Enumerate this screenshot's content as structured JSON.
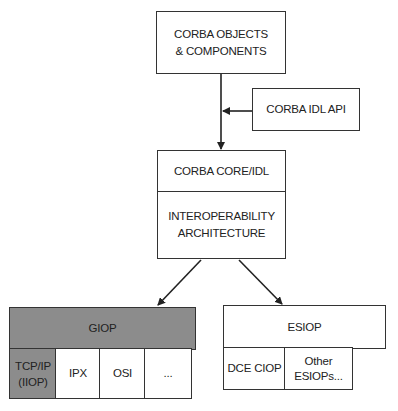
{
  "diagram": {
    "top_box": {
      "line1": "CORBA OBJECTS",
      "line2": "& COMPONENTS"
    },
    "idl_api_box": {
      "label": "CORBA IDL API"
    },
    "core_box": {
      "top_label": "CORBA CORE/IDL",
      "bottom_line1": "INTEROPERABILITY",
      "bottom_line2": "ARCHITECTURE"
    },
    "giop": {
      "label": "GIOP",
      "fill_color": "#8c8c8c",
      "transports": [
        {
          "line1": "TCP/IP",
          "line2": "(IIOP)",
          "highlighted": true
        },
        {
          "line1": "IPX"
        },
        {
          "line1": "OSI"
        },
        {
          "line1": "..."
        }
      ]
    },
    "esiop": {
      "label": "ESIOP",
      "protocols": [
        {
          "line1": "DCE CIOP"
        },
        {
          "line1": "Other",
          "line2": "ESIOPs..."
        }
      ]
    },
    "arrows": [
      {
        "from": "top_box",
        "to": "core_box"
      },
      {
        "from": "idl_api_box",
        "to": "top_to_core_line"
      },
      {
        "from": "core_box",
        "to": "giop"
      },
      {
        "from": "core_box",
        "to": "esiop"
      }
    ]
  }
}
